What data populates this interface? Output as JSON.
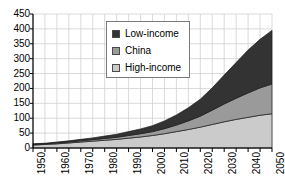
{
  "chart_data": {
    "type": "area",
    "stacked": true,
    "title": "",
    "xlabel": "",
    "ylabel": "",
    "xlim": [
      1950,
      2050
    ],
    "ylim": [
      0,
      450
    ],
    "grid": true,
    "legend_position": "upper-center",
    "x": [
      1950,
      1955,
      1960,
      1965,
      1970,
      1975,
      1980,
      1985,
      1990,
      1995,
      2000,
      2005,
      2010,
      2015,
      2020,
      2025,
      2030,
      2035,
      2040,
      2045,
      2050
    ],
    "xtick_labels": [
      "1950",
      "1960",
      "1970",
      "1980",
      "1990",
      "2000",
      "2010",
      "2020",
      "2030",
      "2040",
      "2050"
    ],
    "ytick_labels": [
      "0",
      "50",
      "100",
      "150",
      "200",
      "250",
      "300",
      "350",
      "400",
      "450"
    ],
    "ytick_values": [
      0,
      50,
      100,
      150,
      200,
      250,
      300,
      350,
      400,
      450
    ],
    "series": [
      {
        "name": "High-income",
        "color": "#cbcbcb",
        "values": [
          10,
          12,
          14,
          17,
          20,
          23,
          26,
          29,
          33,
          37,
          42,
          48,
          55,
          62,
          70,
          79,
          88,
          96,
          103,
          110,
          115
        ]
      },
      {
        "name": "China",
        "color": "#9a9a9a",
        "values": [
          2,
          2,
          3,
          3,
          4,
          5,
          6,
          7,
          9,
          11,
          13,
          17,
          22,
          29,
          37,
          48,
          60,
          71,
          82,
          92,
          100
        ]
      },
      {
        "name": "Low-income",
        "color": "#333333",
        "values": [
          2,
          2,
          3,
          4,
          5,
          6,
          8,
          10,
          13,
          16,
          20,
          26,
          34,
          44,
          57,
          75,
          97,
          120,
          144,
          163,
          180
        ]
      }
    ],
    "stack_order_bottom_to_top": [
      "High-income",
      "China",
      "Low-income"
    ],
    "totals_2050": {
      "High-income": 115,
      "High-income+China": 215,
      "all": 395
    }
  },
  "legend": {
    "items": [
      {
        "label": "Low-income",
        "color": "#333333"
      },
      {
        "label": "China",
        "color": "#9a9a9a"
      },
      {
        "label": "High-income",
        "color": "#cbcbcb"
      }
    ]
  }
}
